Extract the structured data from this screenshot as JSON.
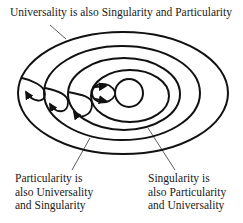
{
  "diagram": {
    "title": "Universality is also Singularity and Particularity",
    "labels": {
      "left": [
        "Particularity is",
        "also Universality",
        "and Singularity"
      ],
      "right": [
        "Singularity is",
        "also Particularity",
        "and Universality"
      ]
    },
    "elements": {
      "ellipses": [
        "outer-ellipse",
        "second-ellipse",
        "third-ellipse",
        "fourth-ellipse",
        "inner-circle"
      ],
      "loops": [
        "loop-1",
        "loop-2",
        "loop-3",
        "loop-4"
      ]
    },
    "colors": {
      "stroke": "#111111",
      "background": "#ffffff"
    }
  }
}
